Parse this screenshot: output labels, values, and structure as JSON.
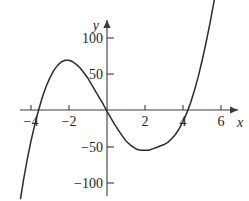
{
  "figure": {
    "top_fragment_text": "",
    "background_color": "#ffffff",
    "curve_color": "#2b2b2b",
    "axis_color": "#3a3a3a"
  },
  "axes": {
    "x_name": "x",
    "y_name": "y",
    "x_ticks": [
      {
        "value": -4,
        "label": "−4"
      },
      {
        "value": -2,
        "label": "−2"
      },
      {
        "value": 2,
        "label": "2"
      },
      {
        "value": 4,
        "label": "4"
      },
      {
        "value": 6,
        "label": "6"
      }
    ],
    "y_ticks": [
      {
        "value": 100,
        "label": "100"
      },
      {
        "value": 50,
        "label": "50"
      },
      {
        "value": -50,
        "label": "−50"
      },
      {
        "value": -100,
        "label": "−100"
      }
    ]
  },
  "chart_data": {
    "type": "line",
    "title": "",
    "xlabel": "x",
    "ylabel": "y",
    "xlim": [
      -4.6,
      6.4
    ],
    "ylim": [
      -130,
      135
    ],
    "grid": false,
    "legend": false,
    "x_intercepts": [
      -4,
      1,
      4.8
    ],
    "local_maximum": {
      "x": -2,
      "y": 69
    },
    "local_minimum": {
      "x": 3,
      "y": -55
    },
    "series": [
      {
        "name": "cubic",
        "x": [
          -4.55,
          -4.4,
          -4.2,
          -4.0,
          -3.8,
          -3.6,
          -3.4,
          -3.2,
          -3.0,
          -2.8,
          -2.6,
          -2.4,
          -2.2,
          -2.0,
          -1.8,
          -1.6,
          -1.4,
          -1.2,
          -1.0,
          -0.8,
          -0.6,
          -0.4,
          -0.2,
          0.0,
          0.2,
          0.4,
          0.6,
          0.8,
          1.0,
          1.2,
          1.4,
          1.6,
          1.8,
          2.0,
          2.2,
          2.4,
          2.6,
          2.8,
          3.0,
          3.2,
          3.4,
          3.6,
          3.8,
          4.0,
          4.2,
          4.4,
          4.6,
          4.8,
          5.0,
          5.2,
          5.4,
          5.6,
          5.8,
          6.0,
          6.1
        ],
        "y": [
          -123,
          -98,
          -69,
          -43,
          -20,
          0,
          18,
          33,
          45,
          55,
          62,
          67,
          69,
          69,
          67,
          63,
          58,
          51,
          44,
          35,
          26,
          17,
          8,
          -2,
          -11,
          -20,
          -28,
          -36,
          -43,
          -48,
          -52,
          -55,
          -56,
          -56,
          -56,
          -54,
          -52,
          -50,
          -48,
          -45,
          -40,
          -34,
          -26,
          -16,
          -4,
          10,
          27,
          46,
          68,
          92,
          118,
          146,
          176,
          208,
          224
        ]
      }
    ]
  }
}
